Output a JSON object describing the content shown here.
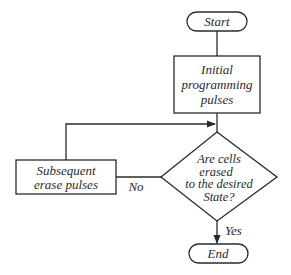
{
  "diagram": {
    "type": "flowchart",
    "nodes": {
      "start": {
        "label": "Start",
        "shape": "terminator"
      },
      "initial": {
        "label_lines": [
          "Initial",
          "programming",
          "pulses"
        ],
        "shape": "process"
      },
      "decision": {
        "label_lines": [
          "Are cells",
          "erased",
          "to the desired",
          "State?"
        ],
        "shape": "decision"
      },
      "subsequent": {
        "label_lines": [
          "Subsequent",
          "erase pulses"
        ],
        "shape": "process"
      },
      "end": {
        "label": "End",
        "shape": "terminator"
      }
    },
    "edges": [
      {
        "from": "start",
        "to": "initial",
        "label": ""
      },
      {
        "from": "initial",
        "to": "decision",
        "label": ""
      },
      {
        "from": "decision",
        "to": "subsequent",
        "label": "No"
      },
      {
        "from": "subsequent",
        "to": "decision",
        "label": ""
      },
      {
        "from": "decision",
        "to": "end",
        "label": "Yes"
      }
    ],
    "edge_labels": {
      "no": "No",
      "yes": "Yes"
    },
    "colors": {
      "stroke": "#2a2a2a",
      "background": "#ffffff"
    }
  }
}
